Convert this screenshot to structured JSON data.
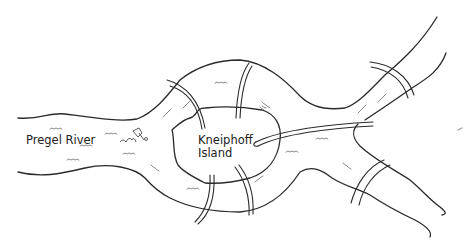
{
  "diagram": {
    "labels": {
      "river": "Pregel River",
      "island_line1": "Kneiphoff",
      "island_line2": "Island"
    },
    "colors": {
      "ink": "#2a2a2a",
      "background": "#ffffff"
    },
    "bridge_count": 7
  }
}
